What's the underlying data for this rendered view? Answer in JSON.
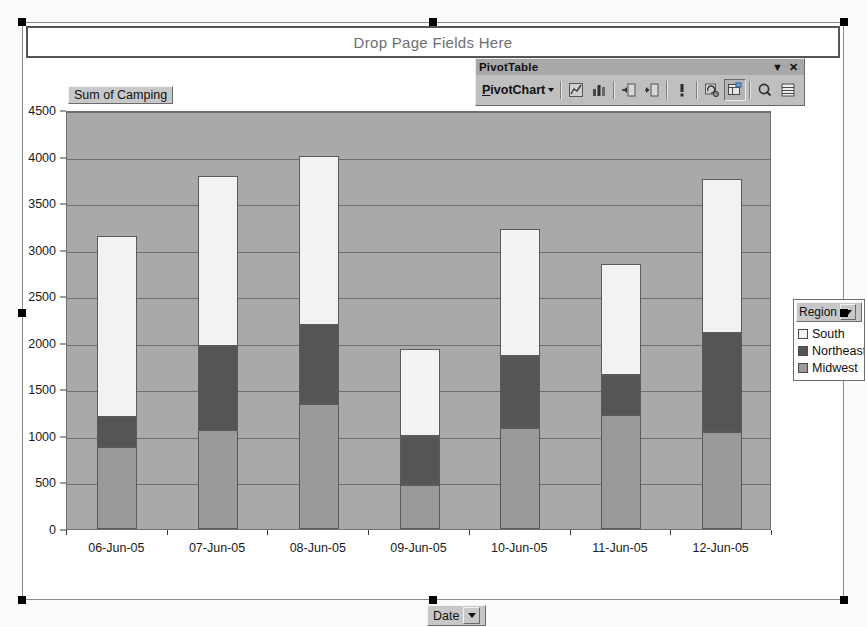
{
  "page_field_area": {
    "label": "Drop Page Fields Here"
  },
  "series_field_button": {
    "label": "Sum of Camping"
  },
  "category_field_button": {
    "label": "Date",
    "dropdown_icon": "chevron-down-icon"
  },
  "legend": {
    "title": "Region",
    "dropdown_icon": "chevron-down-icon",
    "entries": [
      {
        "label": "South",
        "color": "#f2f2f2"
      },
      {
        "label": "Northeast",
        "color": "#555555"
      },
      {
        "label": "Midwest",
        "color": "#9a9a9a"
      }
    ]
  },
  "toolbar": {
    "title": "PivotTable",
    "dropdown_icon": "chevron-down-icon",
    "close_icon": "close-icon",
    "menu_label": "PivotChart",
    "menu_caret_icon": "chevron-down-icon",
    "buttons": [
      {
        "name": "chart-wizard-icon",
        "glyph": "◤"
      },
      {
        "name": "chart-type-icon",
        "glyph": "ὌA"
      },
      {
        "name": "hide-detail-icon",
        "glyph": "−"
      },
      {
        "name": "show-detail-icon",
        "glyph": "+"
      },
      {
        "name": "field-settings-icon",
        "glyph": "!"
      },
      {
        "name": "refresh-data-icon",
        "glyph": "↻"
      },
      {
        "name": "include-hidden-items-icon",
        "glyph": "▤"
      },
      {
        "name": "field-list-icon",
        "glyph": "Q"
      },
      {
        "name": "display-fields-icon",
        "glyph": "☷"
      }
    ]
  },
  "chart_data": {
    "type": "bar",
    "subtype": "stacked-column",
    "title": "",
    "xlabel": "Date",
    "ylabel": "Sum of Camping",
    "ylim": [
      0,
      4500
    ],
    "ytick_step": 500,
    "grid": true,
    "legend_position": "right",
    "plot_background": "#a9a9a9",
    "categories": [
      "06-Jun-05",
      "07-Jun-05",
      "08-Jun-05",
      "09-Jun-05",
      "10-Jun-05",
      "11-Jun-05",
      "12-Jun-05"
    ],
    "yticks": [
      0,
      500,
      1000,
      1500,
      2000,
      2500,
      3000,
      3500,
      4000,
      4500
    ],
    "series": [
      {
        "name": "Midwest",
        "color": "#9a9a9a",
        "values": [
          880,
          1060,
          1340,
          470,
          1080,
          1220,
          1040
        ]
      },
      {
        "name": "Northeast",
        "color": "#555555",
        "values": [
          320,
          910,
          850,
          530,
          780,
          430,
          1070
        ]
      },
      {
        "name": "South",
        "color": "#f2f2f2",
        "values": [
          1950,
          1820,
          1820,
          930,
          1360,
          1200,
          1650
        ]
      }
    ],
    "totals": [
      3150,
      3790,
      4010,
      1930,
      3220,
      2850,
      3760
    ]
  }
}
